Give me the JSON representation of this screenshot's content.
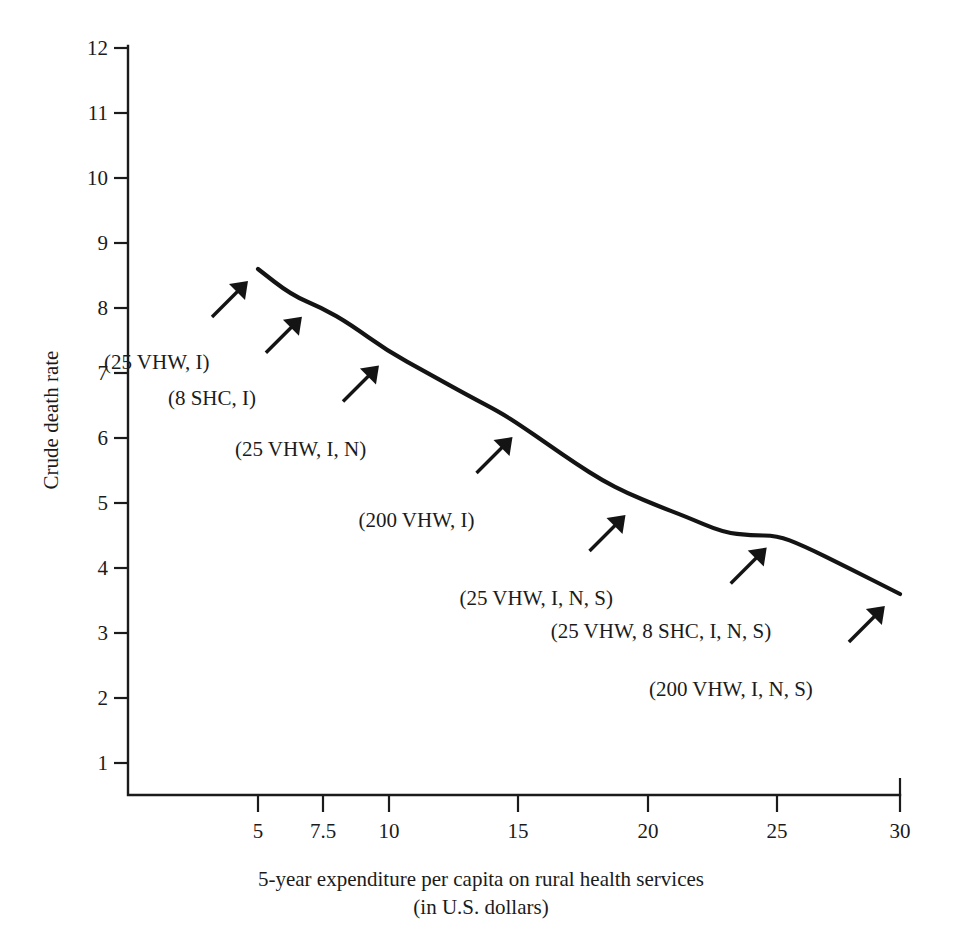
{
  "chart_data": {
    "type": "line",
    "title": "",
    "xlabel": "5-year expenditure per capita on rural health services (in U.S. dollars)",
    "xlabel_line1": "5-year expenditure per capita on rural health services",
    "xlabel_line2": "(in U.S. dollars)",
    "ylabel": "Crude death rate",
    "xlim": [
      0,
      31.5
    ],
    "ylim": [
      0.4,
      12
    ],
    "grid": false,
    "legend": "none",
    "xticks": [
      5,
      7.5,
      10,
      15,
      20,
      25,
      30
    ],
    "xtick_labels": [
      "5",
      "7.5",
      "10",
      "15",
      "20",
      "25",
      "30"
    ],
    "yticks": [
      1,
      2,
      3,
      4,
      5,
      6,
      7,
      8,
      9,
      10,
      11,
      12
    ],
    "ytick_labels": [
      "1",
      "2",
      "3",
      "4",
      "5",
      "6",
      "7",
      "8",
      "9",
      "10",
      "11",
      "12"
    ],
    "series": [
      {
        "name": "Crude death rate",
        "x": [
          5.0,
          6.3,
          7.5,
          8.6,
          10.0,
          11.6,
          13.2,
          14.4,
          15.2,
          16.3,
          17.4,
          18.4,
          19.4,
          20.6,
          21.6,
          23.1,
          24.2,
          25.2,
          26.2,
          28.0,
          30.0
        ],
        "y": [
          8.6,
          8.2,
          8.0,
          7.75,
          7.35,
          7.0,
          6.65,
          6.4,
          6.2,
          5.9,
          5.6,
          5.35,
          5.15,
          4.95,
          4.8,
          4.55,
          4.5,
          4.5,
          4.35,
          4.0,
          3.6
        ]
      }
    ],
    "annotations": [
      {
        "label": "(25 VHW, I)",
        "point_x": 5.0,
        "point_y": 8.6
      },
      {
        "label": "(8 SHC, I)",
        "point_x": 7.1,
        "point_y": 8.05
      },
      {
        "label": "(25 VHW, I, N)",
        "point_x": 10.1,
        "point_y": 7.3
      },
      {
        "label": "(200 VHW, I)",
        "point_x": 15.3,
        "point_y": 6.2
      },
      {
        "label": "(25 VHW, I, N, S)",
        "point_x": 19.7,
        "point_y": 5.0
      },
      {
        "label": "(25 VHW, 8 SHC, I, N, S)",
        "point_x": 25.2,
        "point_y": 4.5
      },
      {
        "label": "(200 VHW, I, N, S)",
        "point_x": 29.8,
        "point_y": 3.6
      }
    ]
  },
  "colors": {
    "ink": "#1b1b1b",
    "curve": "#141414",
    "background": "#ffffff"
  }
}
